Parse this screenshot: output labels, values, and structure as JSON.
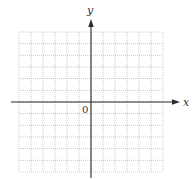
{
  "chart_data": {
    "type": "scatter",
    "title": "",
    "xlabel": "x",
    "ylabel": "y",
    "origin_label": "0",
    "series": [],
    "xlim": [
      -6,
      6
    ],
    "ylim": [
      -6,
      6
    ],
    "grid": true,
    "grid_style": "dotted",
    "grid_columns": 12,
    "grid_rows": 12,
    "tick_labels_x": [],
    "tick_labels_y": [],
    "legend": null
  },
  "colors": {
    "axis": "#2a2a2a",
    "grid": "#b9b9b9",
    "background": "#ffffff"
  }
}
